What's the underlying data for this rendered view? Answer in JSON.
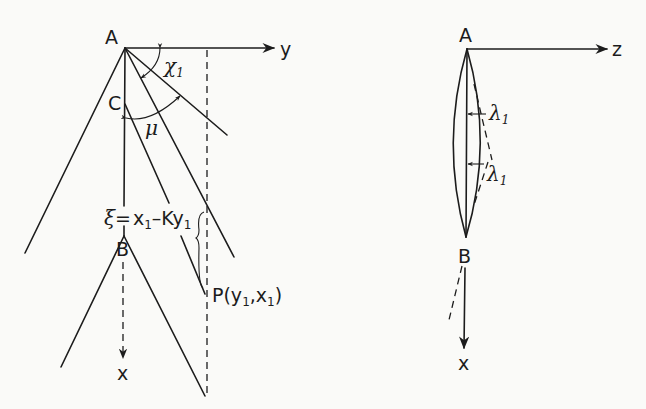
{
  "left_diagram": {
    "point_A": "A",
    "point_C": "C",
    "point_B": "B",
    "axis_y": "y",
    "axis_x": "x",
    "angle_chi": {
      "symbol": "χ",
      "sub": "1"
    },
    "angle_mu": "μ",
    "xi_eq": {
      "lhs": "ξ",
      "eq": "=",
      "x": "x",
      "x_sub": "1",
      "minus_k": "–Ky",
      "y_sub": "1"
    },
    "point_P": {
      "name": "P(y",
      "sub1": "1",
      "mid": ",x",
      "sub2": "1",
      "close": ")"
    }
  },
  "right_diagram": {
    "point_A": "A",
    "point_B": "B",
    "axis_z": "z",
    "axis_x": "x",
    "lambda_upper": {
      "symbol": "λ",
      "sub": "1"
    },
    "lambda_lower": {
      "symbol": "λ",
      "sub": "1"
    }
  },
  "colors": {
    "ink": "#1c1c1c",
    "paper": "#fafaf8"
  }
}
